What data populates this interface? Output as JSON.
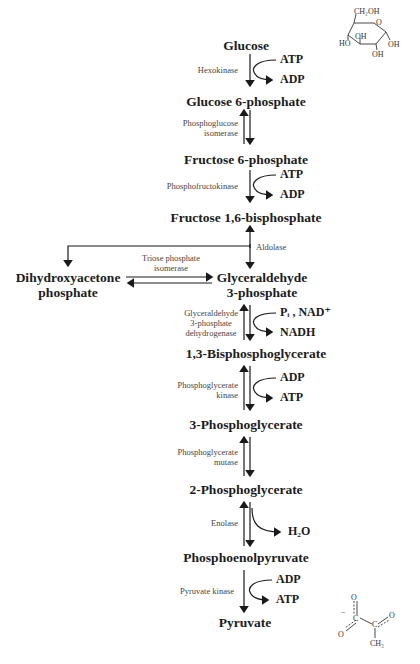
{
  "diagram": {
    "metabolites": {
      "glucose": "Glucose",
      "g6p": "Glucose 6-phosphate",
      "f6p": "Fructose 6-phosphate",
      "f16bp": "Fructose 1,6-bisphosphate",
      "dhap_line1": "Dihydroxyacetone",
      "dhap_line2": "phosphate",
      "g3p_line1": "Glyceraldehyde",
      "g3p_line2": "3-phosphate",
      "bpg13": "1,3-Bisphosphoglycerate",
      "pg3": "3-Phosphoglycerate",
      "pg2": "2-Phosphoglycerate",
      "pep": "Phosphoenolpyruvate",
      "pyruvate": "Pyruvate"
    },
    "enzymes": {
      "hexokinase": "Hexokinase",
      "pgi_line1": "Phosphoglucose",
      "pgi_line2": "isomerase",
      "pfk": "Phosphofructokinase",
      "aldolase": "Aldolase",
      "tpi_line1": "Triose phosphate",
      "tpi_line2": "isomerase",
      "gapdh_line1": "Glyceraldehyde",
      "gapdh_line2": "3-phosphate",
      "gapdh_line3": "dehydrogenase",
      "pgk_line1": "Phosphoglycerate",
      "pgk_line2": "kinase",
      "pgm_line1": "Phosphoglycerate",
      "pgm_line2": "mutase",
      "enolase": "Enolase",
      "pk": "Pyruvate kinase"
    },
    "cofactors": {
      "hk_in": "ATP",
      "hk_out": "ADP",
      "pfk_in": "ATP",
      "pfk_out": "ADP",
      "gapdh_in": "Pᵢ , NAD⁺",
      "gapdh_out": "NADH",
      "pgk_in": "ADP",
      "pgk_out": "ATP",
      "enolase_out": "H₂O",
      "pk_in": "ADP",
      "pk_out": "ATP"
    },
    "structures": {
      "glucose": {
        "ch2oh": "CH₂OH",
        "o": "O",
        "oh_a": "OH",
        "ho": "HO",
        "oh_b": "OH",
        "oh_c": "OH"
      },
      "pyruvate": {
        "minus": "−",
        "o_top": "O",
        "o_left": "O",
        "c1": "C",
        "c2": "C",
        "o_right": "O",
        "ch3": "CH₃"
      }
    }
  }
}
